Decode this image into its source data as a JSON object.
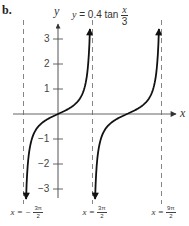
{
  "panel_label": "b.",
  "chart_data": {
    "type": "line",
    "title_parts": {
      "lhs": "y",
      "eq": "= 0.4 tan",
      "num": "x",
      "den": "3"
    },
    "function": "y = 0.4*tan(x/3)",
    "xlabel": "x",
    "ylabel": "y",
    "y_ticks": [
      3,
      2,
      1,
      -1,
      -2,
      -3
    ],
    "ylim": [
      -3.4,
      3.4
    ],
    "grid": false,
    "asymptotes": [
      {
        "x_expr": "-3π/2",
        "x": -4.712,
        "label_lhs": "x = −",
        "num": "3π",
        "den": "2"
      },
      {
        "x_expr": "3π/2",
        "x": 4.712,
        "label_lhs": "x =",
        "num": "3π",
        "den": "2"
      },
      {
        "x_expr": "9π/2",
        "x": 14.137,
        "label_lhs": "x =",
        "num": "9π",
        "den": "2"
      }
    ],
    "series": [
      {
        "name": "branch-1",
        "x_range": [
          "-3π/2",
          "3π/2"
        ],
        "center": 0,
        "points": [
          [
            -4.36,
            -3.4
          ],
          [
            -3.0,
            -1.23
          ],
          [
            -1.5,
            -0.22
          ],
          [
            0,
            0
          ],
          [
            1.5,
            0.22
          ],
          [
            3.0,
            1.23
          ],
          [
            4.36,
            3.4
          ]
        ]
      },
      {
        "name": "branch-2",
        "x_range": [
          "3π/2",
          "9π/2"
        ],
        "center": 9.425,
        "points": [
          [
            5.06,
            -3.4
          ],
          [
            6.42,
            -1.23
          ],
          [
            7.92,
            -0.22
          ],
          [
            9.425,
            0
          ],
          [
            10.92,
            0.22
          ],
          [
            12.42,
            1.23
          ],
          [
            13.78,
            3.4
          ]
        ]
      }
    ],
    "colors": {
      "curve": "#111111",
      "axis": "#555555",
      "asymptote": "#777777"
    }
  }
}
